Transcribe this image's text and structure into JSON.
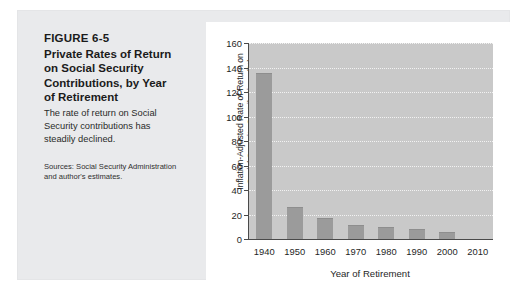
{
  "figure": {
    "number": "FIGURE 6-5",
    "title": "Private Rates of Return on Social Security Contributions, by Year of Retirement",
    "description": "The rate of return on Social Security contributions has steadily declined.",
    "source": "Sources: Social Security Administration and author's estimates."
  },
  "chart_data": {
    "type": "bar",
    "title": "",
    "xlabel": "Year of Retirement",
    "ylabel_line1": "Inflation-Adjusted Rate of Return on",
    "ylabel_line2": "Social Security Contributions (%)",
    "categories": [
      "1940",
      "1950",
      "1960",
      "1970",
      "1980",
      "1990",
      "2000",
      "2010"
    ],
    "values": [
      135,
      25,
      16,
      11,
      9,
      7,
      5,
      null
    ],
    "ylim": [
      0,
      160
    ],
    "yticks": [
      0,
      20,
      40,
      60,
      80,
      100,
      120,
      140,
      160
    ],
    "ytick_labels": [
      "0",
      "20",
      "40",
      "60",
      "80",
      "100",
      "120",
      "140",
      "160"
    ],
    "grid": true,
    "legend": "none",
    "bar_color": "#9b9b9b",
    "plot_background": "#c9c9c9",
    "axis_color": "#4a4a4a"
  }
}
